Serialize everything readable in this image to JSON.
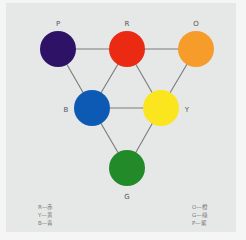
{
  "diagram": {
    "type": "color-relationship-triangle",
    "nodes": [
      {
        "id": "P",
        "label": "P",
        "color": "#2e1265",
        "cx": 58,
        "cy": 49
      },
      {
        "id": "R",
        "label": "R",
        "color": "#ea2a12",
        "cx": 127,
        "cy": 49
      },
      {
        "id": "O",
        "label": "O",
        "color": "#f59c2a",
        "cx": 196,
        "cy": 49
      },
      {
        "id": "B",
        "label": "B",
        "color": "#0d5ab5",
        "cx": 92,
        "cy": 108
      },
      {
        "id": "Y",
        "label": "Y",
        "color": "#fbe51e",
        "cx": 161,
        "cy": 108
      },
      {
        "id": "G",
        "label": "G",
        "color": "#228a28",
        "cx": 127,
        "cy": 168
      }
    ],
    "edges": [
      [
        "P",
        "R"
      ],
      [
        "R",
        "O"
      ],
      [
        "P",
        "B"
      ],
      [
        "R",
        "B"
      ],
      [
        "R",
        "Y"
      ],
      [
        "O",
        "Y"
      ],
      [
        "B",
        "Y"
      ],
      [
        "B",
        "G"
      ],
      [
        "Y",
        "G"
      ]
    ],
    "line_color": "#777777",
    "background": "#e6e8e7"
  },
  "legend": {
    "left": [
      "R—赤",
      "Y—黄",
      "B—青"
    ],
    "right": [
      "O—橙",
      "G—綠",
      "P—紫"
    ]
  }
}
